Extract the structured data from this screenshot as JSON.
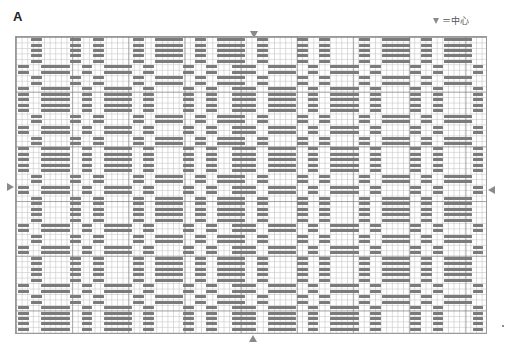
{
  "chart_label": "A",
  "legend": {
    "symbol": "▼",
    "text": "＝中心"
  },
  "chart_data": {
    "type": "table",
    "title": "A",
    "legend": "▼ = center (中心)",
    "grid": {
      "left": 15,
      "top": 36,
      "width": 472,
      "height": 298,
      "major_every": 10
    },
    "bar_color": "#7b7b7b",
    "column_sets": {
      "X": [
        [
          31,
          42
        ],
        [
          70,
          81
        ],
        [
          93,
          104
        ],
        [
          133,
          144
        ],
        [
          155,
          183
        ],
        [
          195,
          206
        ],
        [
          217,
          245
        ],
        [
          257,
          268
        ],
        [
          297,
          308
        ],
        [
          319,
          330
        ],
        [
          359,
          370
        ],
        [
          382,
          410
        ],
        [
          421,
          432
        ],
        [
          444,
          472
        ]
      ],
      "Y": [
        [
          18,
          29
        ],
        [
          41,
          70
        ],
        [
          82,
          92
        ],
        [
          104,
          132
        ],
        [
          143,
          154
        ],
        [
          183,
          194
        ],
        [
          206,
          217
        ],
        [
          232,
          256
        ],
        [
          268,
          296
        ],
        [
          308,
          318
        ],
        [
          330,
          359
        ],
        [
          370,
          381
        ],
        [
          410,
          421
        ],
        [
          433,
          443
        ],
        [
          473,
          483
        ]
      ]
    },
    "row_sequence": [
      "X5",
      "Y2",
      "X2",
      "Y5",
      "X2",
      "Y2",
      "X2",
      "Y5",
      "X2",
      "Y2",
      "X5",
      "Y2",
      "X2",
      "Y2",
      "X5",
      "Y2",
      "X2",
      "Y5"
    ],
    "row_start_y": 38,
    "row_pitch": 5.47,
    "center_markers": {
      "top_x": 254,
      "bottom_x": 253,
      "left_y": 187,
      "right_y": 190
    }
  }
}
